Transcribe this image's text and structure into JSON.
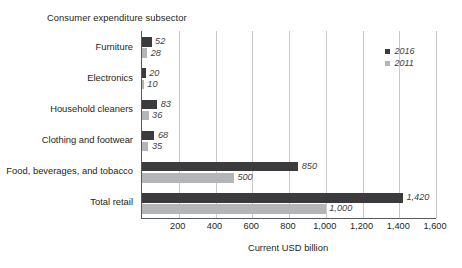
{
  "chart_data": {
    "type": "bar",
    "orientation": "horizontal",
    "title": "",
    "ylabel": "Consumer expenditure subsector",
    "xlabel": "Current USD billion",
    "categories": [
      "Furniture",
      "Electronics",
      "Household cleaners",
      "Clothing and footwear",
      "Food, beverages, and tobacco",
      "Total retail"
    ],
    "series": [
      {
        "name": "2016",
        "color": "#3b3b3d",
        "values": [
          52,
          20,
          83,
          68,
          850,
          1420
        ],
        "labels": [
          "52",
          "20",
          "83",
          "68",
          "850",
          "1,420"
        ]
      },
      {
        "name": "2011",
        "color": "#b4b5b6",
        "values": [
          28,
          10,
          36,
          35,
          500,
          1000
        ],
        "labels": [
          "28",
          "10",
          "36",
          "35",
          "500",
          "1,000"
        ]
      }
    ],
    "xlim": [
      0,
      1600
    ],
    "xticks": [
      0,
      200,
      400,
      600,
      800,
      1000,
      1200,
      1400,
      1600
    ],
    "xticklabels": [
      "",
      "200",
      "400",
      "600",
      "800",
      "1,000",
      "1,200",
      "1,400",
      "1,600"
    ],
    "grid": "vertical",
    "legend_position": "top-right"
  }
}
